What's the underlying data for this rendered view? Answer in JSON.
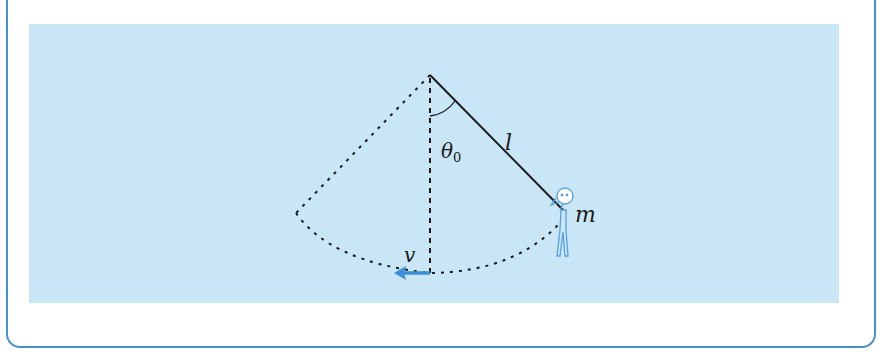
{
  "figure": {
    "type": "pendulum-swing-diagram",
    "colors": {
      "frame_border": "#4a8fd0",
      "panel_background": "#c9e6f6",
      "line": "#1a1a1a",
      "velocity_arrow": "#3a8fd8",
      "figure_outline": "#5aa0e0"
    },
    "labels": {
      "angle": "θ",
      "angle_subscript": "0",
      "length": "l",
      "mass": "m",
      "velocity": "v"
    },
    "elements": {
      "pivot": "pivot-point",
      "rope": "solid-line-length-l",
      "vertical_reference": "dashed-vertical-line",
      "mirror_rope": "dotted-line-left",
      "swing_arc": "dotted-arc",
      "person": "stick-figure-holding-rope",
      "velocity_arrow": "blue-arrow-left"
    }
  }
}
